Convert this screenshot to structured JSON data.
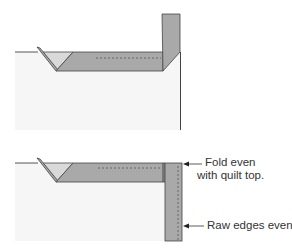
{
  "diagram": {
    "colors": {
      "quilt_top": "#f6f6f6",
      "binding": "#a9a9a9",
      "binding_light": "#d9d9d9",
      "outline": "#444444",
      "stitch": "#666666"
    },
    "steps": [
      {
        "id": "step-1",
        "description": "Binding strip folded up at 45-degree angle away from quilt"
      },
      {
        "id": "step-2",
        "description": "Binding strip folded back down along next edge"
      }
    ],
    "labels": {
      "fold": "Fold even\nwith quilt top.",
      "fold_line1": "Fold even",
      "fold_line2": "with quilt top.",
      "raw_edges": "Raw edges even"
    }
  }
}
